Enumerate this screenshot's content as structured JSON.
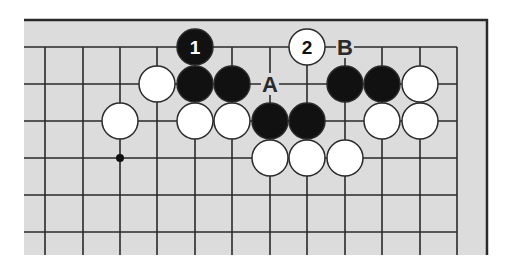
{
  "diagram": {
    "type": "go-board-fragment",
    "colors": {
      "background": "#ffffff",
      "board": "#dcdcdc",
      "line": "#2a2a2a",
      "black_stone": "#111111",
      "white_stone": "#ffffff"
    },
    "grid": {
      "cols_x": [
        45,
        83,
        120,
        157,
        195,
        232,
        270,
        307,
        345,
        382,
        420,
        457
      ],
      "rows_y": [
        47,
        84,
        121,
        158,
        195,
        232
      ],
      "board_edge_right_col": 11,
      "board_edge_top_row": 0
    },
    "hoshi": [
      {
        "col": 2,
        "row": 3
      }
    ],
    "stones": [
      {
        "color": "black",
        "col": 4,
        "row": 0,
        "label": "1"
      },
      {
        "color": "white",
        "col": 7,
        "row": 0,
        "label": "2"
      },
      {
        "color": "white",
        "col": 3,
        "row": 1,
        "label": ""
      },
      {
        "color": "black",
        "col": 4,
        "row": 1,
        "label": ""
      },
      {
        "color": "black",
        "col": 5,
        "row": 1,
        "label": ""
      },
      {
        "color": "black",
        "col": 8,
        "row": 1,
        "label": ""
      },
      {
        "color": "black",
        "col": 9,
        "row": 1,
        "label": ""
      },
      {
        "color": "white",
        "col": 10,
        "row": 1,
        "label": ""
      },
      {
        "color": "white",
        "col": 2,
        "row": 2,
        "label": ""
      },
      {
        "color": "white",
        "col": 4,
        "row": 2,
        "label": ""
      },
      {
        "color": "white",
        "col": 5,
        "row": 2,
        "label": ""
      },
      {
        "color": "black",
        "col": 6,
        "row": 2,
        "label": ""
      },
      {
        "color": "black",
        "col": 7,
        "row": 2,
        "label": ""
      },
      {
        "color": "white",
        "col": 9,
        "row": 2,
        "label": ""
      },
      {
        "color": "white",
        "col": 10,
        "row": 2,
        "label": ""
      },
      {
        "color": "white",
        "col": 6,
        "row": 3,
        "label": ""
      },
      {
        "color": "white",
        "col": 7,
        "row": 3,
        "label": ""
      },
      {
        "color": "white",
        "col": 8,
        "row": 3,
        "label": ""
      }
    ],
    "markers": [
      {
        "text": "A",
        "col": 6,
        "row": 1
      },
      {
        "text": "B",
        "col": 8,
        "row": 0
      }
    ]
  }
}
